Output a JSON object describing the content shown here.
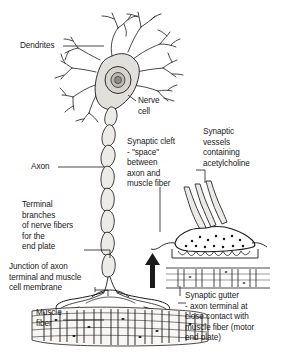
{
  "figure": {
    "domain": "anatomy-diagram",
    "colors": {
      "ink": "#1a1a1a",
      "leader_line": "#1a1a1a",
      "paper": "#ffffff",
      "soma_fill": "#e2e0dd",
      "nucleus_fill": "#c9c6c1",
      "nucleolus_fill": "#8d8a86",
      "axon_fill": "#eceae7",
      "terminal_fill": "#ffffff",
      "muscle_fill": "#f5f4f2"
    }
  },
  "labels": {
    "dendrites": {
      "text": "Dendrites",
      "x": 20,
      "y": 42
    },
    "nerve_cell": {
      "text": "Nerve\ncell",
      "x": 137,
      "y": 98
    },
    "axon": {
      "text": "Axon",
      "x": 32,
      "y": 164
    },
    "synaptic_cleft": {
      "text": "Synaptic cleft\n- \"space\"\nbetween\naxon and\nmuscle fiber",
      "x": 128,
      "y": 140
    },
    "synaptic_vessels": {
      "text": "Synaptic\nvessels\ncontaining\nacetylcholine",
      "x": 203,
      "y": 128
    },
    "terminal_branches": {
      "text": "Terminal\nbranches\nof nerve fibers\nfor the\nend plate",
      "x": 24,
      "y": 202
    },
    "junction": {
      "text": "Junction of axon\nterminal and muscle\ncell membrane",
      "x": 10,
      "y": 264
    },
    "muscle_fiber": {
      "text": "Muscle\nfiber",
      "x": 36,
      "y": 310
    },
    "synaptic_gutter": {
      "text": "Synaptic gutter\n- axon terminal at\nclose contact with\nmuscle fiber (motor\nend plate)",
      "x": 184,
      "y": 293
    }
  },
  "diagram_parts": [
    {
      "name": "dendrite-tree",
      "description": "branched dendrites radiating from nerve cell body"
    },
    {
      "name": "nerve-cell-body",
      "description": "soma with nucleus and nucleolus"
    },
    {
      "name": "myelinated-axon",
      "description": "segmented axon descending from soma"
    },
    {
      "name": "axon-terminal-branches",
      "description": "terminal branches spreading onto muscle"
    },
    {
      "name": "muscle-fiber-striations",
      "description": "striated skeletal muscle fiber band"
    },
    {
      "name": "synapse-detail-inset",
      "description": "enlarged axon terminal showing vesicles and synaptic gutter"
    },
    {
      "name": "magnify-arrow",
      "description": "upward arrow linking muscle surface to inset detail"
    }
  ]
}
